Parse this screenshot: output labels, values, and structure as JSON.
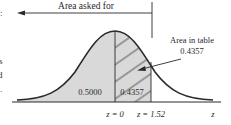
{
  "diagram": {
    "type": "normal-distribution-area",
    "top_label": "Area asked for",
    "table_label_line1": "Area in table",
    "table_label_line2": "0.4357",
    "left_area_value": "0.5000",
    "right_area_value": "0.4357",
    "axis_label": "z",
    "z0_label": "z = 0",
    "z1_label": "z = 1.52",
    "edge_fragments": [
      ":",
      "s",
      "d",
      "."
    ],
    "colors": {
      "shade": "#d9d9d9",
      "line": "#2a2a2a",
      "background": "#ffffff"
    }
  }
}
